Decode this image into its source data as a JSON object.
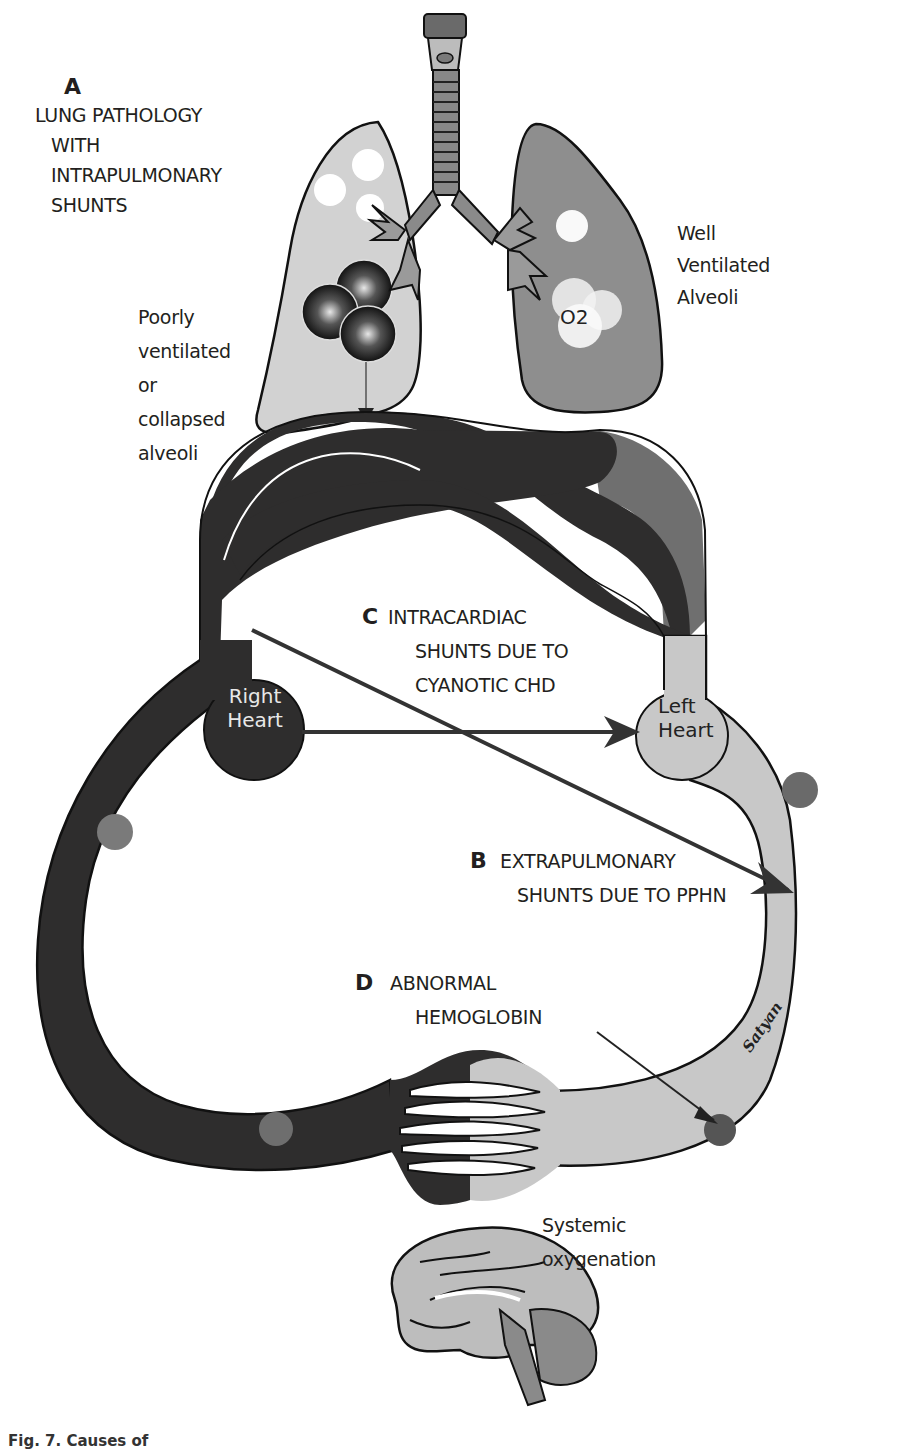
{
  "labels": {
    "a": {
      "letter": "A",
      "lines": [
        "LUNG PATHOLOGY",
        "WITH",
        "INTRAPULMONARY",
        "SHUNTS"
      ]
    },
    "poorly_ventilated": [
      "Poorly",
      "ventilated",
      "or",
      "collapsed",
      "alveoli"
    ],
    "well_ventilated": [
      "Well",
      "Ventilated",
      "Alveoli"
    ],
    "o2": "O2",
    "c": {
      "letter": "C",
      "lines": [
        "INTRACARDIAC",
        "SHUNTS DUE TO",
        "CYANOTIC CHD"
      ]
    },
    "right_heart": [
      "Right",
      "Heart"
    ],
    "left_heart": [
      "Left",
      "Heart"
    ],
    "b": {
      "letter": "B",
      "lines": [
        "EXTRAPULMONARY",
        "SHUNTS DUE TO PPHN"
      ]
    },
    "d": {
      "letter": "D",
      "lines": [
        "ABNORMAL",
        "HEMOGLOBIN"
      ]
    },
    "systemic": [
      "Systemic",
      "oxygenation"
    ],
    "signature": "Satyan",
    "caption": "Fig. 7. Causes of"
  },
  "colors": {
    "deoxygenated": "#2e2d2d",
    "oxygenated": "#c8c8c8",
    "transition": "#6f6f6f",
    "left_lung": "#d2d2d2",
    "right_lung": "#8e8e8e",
    "red_cell": "#7a7a7a",
    "outline": "#111111"
  }
}
